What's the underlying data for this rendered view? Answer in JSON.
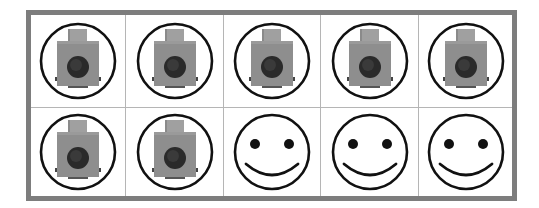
{
  "frame": {
    "columns": 5,
    "rows": 2,
    "border_color": "#7d7d7d",
    "divider_color": "#b5b5b5"
  },
  "cells": [
    {
      "icon": "camera-icon"
    },
    {
      "icon": "camera-icon"
    },
    {
      "icon": "camera-icon"
    },
    {
      "icon": "camera-icon"
    },
    {
      "icon": "camera-icon"
    },
    {
      "icon": "camera-icon"
    },
    {
      "icon": "camera-icon"
    },
    {
      "icon": "smiley-face-icon"
    },
    {
      "icon": "smiley-face-icon"
    },
    {
      "icon": "smiley-face-icon"
    }
  ],
  "counts": {
    "camera-icon": 7,
    "smiley-face-icon": 3,
    "total": 10
  },
  "colors": {
    "ring": "#111111",
    "camera_body": "#8e8e8e",
    "camera_top": "#a0a0a0",
    "camera_lens": "#2a2a2a",
    "smiley_stroke": "#111111"
  }
}
